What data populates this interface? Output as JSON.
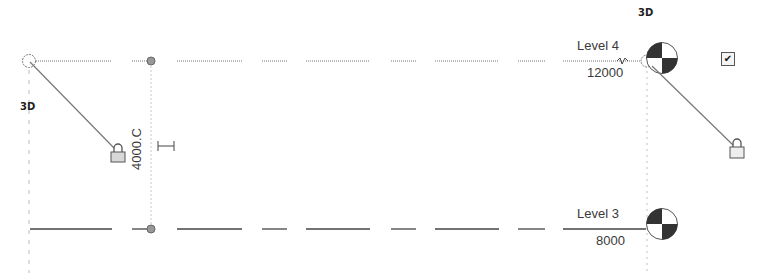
{
  "view": {
    "type": "elevation-view",
    "background": "#ffffff"
  },
  "levels": [
    {
      "name": "Level 4",
      "elevation": "12000",
      "line_style": "dashed-thin",
      "head": "level-head-marker"
    },
    {
      "name": "Level 3",
      "elevation": "8000",
      "line_style": "dashed-thick",
      "head": "level-head-marker"
    }
  ],
  "tags": {
    "left_3d": "3D",
    "right_3d": "3D"
  },
  "dimension": {
    "value": "4000.C"
  },
  "controls": {
    "checkbox_checked_glyph": "✔"
  },
  "colors": {
    "line": "#555555",
    "line_dark": "#333333",
    "grid_dash": "#bbbbbb",
    "marker_dark": "#333333",
    "lock_fill": "#d8d8d8"
  }
}
